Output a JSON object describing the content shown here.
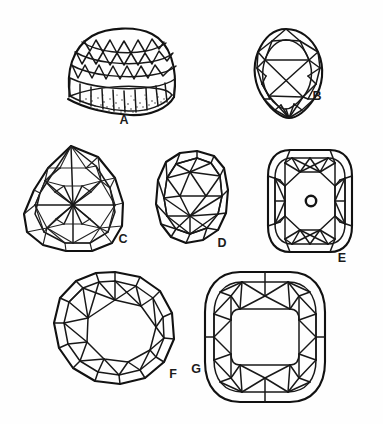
{
  "plate": {
    "title": "Gemstone cut styles plate",
    "background_color": "#fefefe",
    "line_color": "#181818",
    "width": 383,
    "height": 424
  },
  "figures": [
    {
      "id": "A",
      "label": "A",
      "name": "faceted-dome-cabochon-perspective",
      "description": "Three-dimensional perspective view of a domed cut stone with faceted crown rows and a stippled base",
      "label_x": 124,
      "label_y": 121
    },
    {
      "id": "B",
      "label": "B",
      "name": "pear-shaped-brilliant-cut",
      "description": "Pear or drop shaped brilliant cut, face-up view",
      "label_x": 317,
      "label_y": 97
    },
    {
      "id": "C",
      "label": "C",
      "name": "rose-cut-briolette-radial-star",
      "description": "Complex pear outline with dense radial star facet pattern",
      "label_x": 123,
      "label_y": 240
    },
    {
      "id": "D",
      "label": "D",
      "name": "oval-cushion-brilliant-cut",
      "description": "Elongated oval cushion brilliant cut, face-up view",
      "label_x": 222,
      "label_y": 244
    },
    {
      "id": "E",
      "label": "E",
      "name": "cushion-cut-with-culet",
      "description": "Rounded square cushion cut with a small circular culet marked at the centre",
      "label_x": 342,
      "label_y": 259,
      "culet_marker": "O"
    },
    {
      "id": "F",
      "label": "F",
      "name": "round-brilliant-cut",
      "description": "Round brilliant cut with sixteen sided girdle and octagonal table",
      "label_x": 173,
      "label_y": 375
    },
    {
      "id": "G",
      "label": "G",
      "name": "cushion-cut-square-table",
      "description": "Cushion cut with a large rounded square table",
      "label_x": 196,
      "label_y": 370
    }
  ]
}
